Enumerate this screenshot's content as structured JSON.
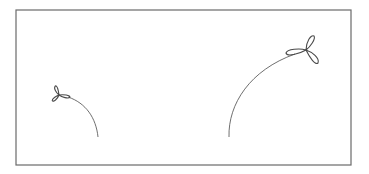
{
  "figure": {
    "frame": {
      "x": 16,
      "y": 10,
      "width": 335,
      "height": 155,
      "stroke": "#6a6a6a"
    },
    "stroke_color": "#4a4a4a",
    "background": "#ffffff",
    "paths": [
      {
        "name": "left-trajectory",
        "arc": "M 98 137 C 96 118, 86 103, 68 97",
        "trefoil": {
          "cx": 59,
          "cy": 95,
          "scale": 0.55,
          "rotation": 200
        }
      },
      {
        "name": "right-trajectory",
        "arc": "M 229 137 C 228 104, 250 70, 295 54",
        "trefoil": {
          "cx": 306,
          "cy": 50,
          "scale": 1.0,
          "rotation": 0
        }
      }
    ]
  }
}
